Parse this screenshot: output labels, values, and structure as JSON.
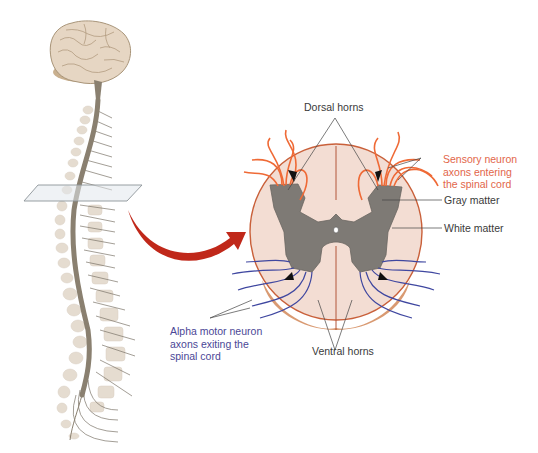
{
  "figure": {
    "labels": {
      "dorsal_horns": "Dorsal horns",
      "sensory_neuron": "Sensory neuron\naxons entering\nthe spinal cord",
      "gray_matter": "Gray matter",
      "white_matter": "White matter",
      "alpha_motor": "Alpha motor neuron\naxons exiting the\nspinal cord",
      "ventral_horns": "Ventral horns"
    },
    "colors": {
      "sensory_axons": "#ef6a36",
      "motor_axons": "#3f47a0",
      "gray_matter": "#7e7a75",
      "white_matter": "#f3ddd3",
      "arrow": "#c0281a",
      "brain": "#e6d6c3",
      "label_dark": "#3a3a3a",
      "label_sensory": "#e2664a",
      "label_motor": "#4b4796"
    }
  }
}
